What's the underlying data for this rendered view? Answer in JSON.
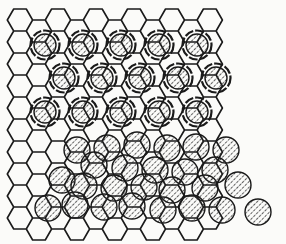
{
  "diagram": {
    "type": "hexagonal-lattice-with-adsorbates",
    "colors": {
      "background": "#fbfbf9",
      "line": "#1a1a1a",
      "hatch": "#333333"
    },
    "lattice": {
      "origin_x": 20,
      "origin_y": 20,
      "hex_width": 25.3,
      "hex_height": 22,
      "cols": 11,
      "rows": 10
    },
    "ordered_adsorbates": [
      [
        45,
        45
      ],
      [
        83,
        45
      ],
      [
        121,
        45
      ],
      [
        159,
        45
      ],
      [
        197,
        45
      ],
      [
        64,
        78
      ],
      [
        102,
        78
      ],
      [
        140,
        78
      ],
      [
        178,
        78
      ],
      [
        216,
        78
      ],
      [
        45,
        112
      ],
      [
        83,
        112
      ],
      [
        121,
        112
      ],
      [
        159,
        112
      ],
      [
        197,
        112
      ]
    ],
    "disordered_adsorbates": [
      [
        77,
        150
      ],
      [
        107,
        148
      ],
      [
        137,
        145
      ],
      [
        167,
        148
      ],
      [
        196,
        147
      ],
      [
        226,
        150
      ],
      [
        94,
        165
      ],
      [
        125,
        168
      ],
      [
        155,
        170
      ],
      [
        185,
        172
      ],
      [
        215,
        170
      ],
      [
        62,
        180
      ],
      [
        84,
        186
      ],
      [
        114,
        188
      ],
      [
        144,
        187
      ],
      [
        172,
        190
      ],
      [
        205,
        188
      ],
      [
        238,
        185
      ],
      [
        48,
        208
      ],
      [
        75,
        205
      ],
      [
        104,
        207
      ],
      [
        132,
        206
      ],
      [
        163,
        210
      ],
      [
        192,
        208
      ],
      [
        222,
        210
      ],
      [
        258,
        212
      ]
    ]
  }
}
